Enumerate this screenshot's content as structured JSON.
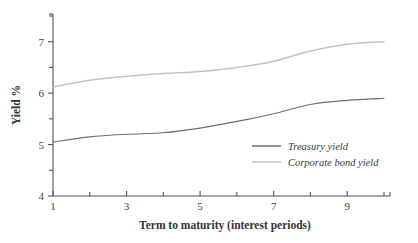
{
  "chart_data": {
    "type": "line",
    "title": "",
    "xlabel": "Term to maturity (interest periods)",
    "ylabel": "Yield %",
    "xlim": [
      1,
      10
    ],
    "ylim": [
      4,
      7.5
    ],
    "grid": false,
    "legend_position": "inside-lower-right",
    "x": [
      1,
      2,
      3,
      4,
      5,
      6,
      7,
      8,
      9,
      10
    ],
    "xticks": [
      1,
      2,
      3,
      4,
      5,
      6,
      7,
      8,
      9,
      10
    ],
    "xticklabels": [
      "1",
      "",
      "3",
      "",
      "5",
      "",
      "7",
      "",
      "9",
      ""
    ],
    "yticks": [
      4,
      4.5,
      5,
      5.5,
      6,
      6.5,
      7,
      7.5
    ],
    "yticklabels": [
      "4",
      "",
      "5",
      "",
      "6",
      "",
      "7",
      ""
    ],
    "series": [
      {
        "name": "Treasury yield",
        "color": "#6e6e6e",
        "values": [
          5.05,
          5.15,
          5.2,
          5.23,
          5.32,
          5.45,
          5.6,
          5.78,
          5.86,
          5.9
        ]
      },
      {
        "name": "Corporate bond yield",
        "color": "#c2c2c2",
        "values": [
          6.12,
          6.25,
          6.33,
          6.38,
          6.42,
          6.5,
          6.62,
          6.82,
          6.95,
          7.0
        ]
      }
    ]
  },
  "legend": {
    "items": [
      {
        "label": "Treasury yield",
        "color": "#6e6e6e"
      },
      {
        "label": "Corporate bond yield",
        "color": "#c2c2c2"
      }
    ]
  },
  "axes": {
    "x_title": "Term to maturity (interest periods)",
    "y_title": "Yield %"
  }
}
